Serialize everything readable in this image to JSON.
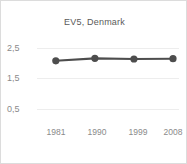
{
  "chart_data": {
    "type": "line",
    "title": "EV5, Denmark",
    "xlabel": "",
    "ylabel": "",
    "categories": [
      "1981",
      "1990",
      "1999",
      "2008"
    ],
    "x": [
      1981,
      1990,
      1999,
      2008
    ],
    "values": [
      2.08,
      2.16,
      2.14,
      2.15
    ],
    "series": [
      {
        "name": "EV5, Denmark",
        "values": [
          2.08,
          2.16,
          2.14,
          2.15
        ]
      }
    ],
    "ylim": [
      0.5,
      2.5
    ],
    "yticks": [
      "0,5",
      "1,5",
      "2,5"
    ],
    "ytick_values": [
      0.5,
      1.5,
      2.5
    ],
    "xticks": [
      "1981",
      "1990",
      "1999",
      "2008"
    ],
    "grid": true,
    "legend": false,
    "legend_position": "none",
    "colors": {
      "line": "#4d4d4d",
      "marker": "#4d4d4d",
      "grid": "#ededed",
      "tick_text": "#8a8a8a",
      "title_text": "#5a5a5a",
      "background": "#ffffff",
      "border": "#dcdcdc"
    }
  }
}
